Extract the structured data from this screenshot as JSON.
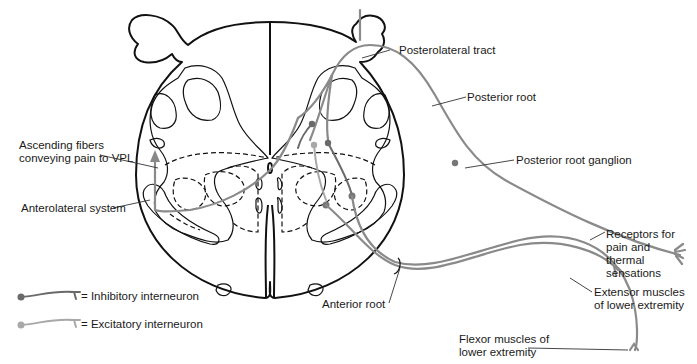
{
  "diagram": {
    "colors": {
      "outline": "#111111",
      "nerve_fiber": "#8a8a8a",
      "excitatory_interneuron": "#a8a8a8",
      "inhibitory_interneuron": "#6a6a6a",
      "background": "#ffffff"
    },
    "labels": {
      "ascending_fibers": "Ascending fibers\nconveying pain to VPL",
      "anterolateral_system": "Anterolateral system",
      "posterolateral_tract": "Posterolateral tract",
      "posterior_root": "Posterior root",
      "posterior_root_ganglion": "Posterior root ganglion",
      "receptors": "Receptors for\npain and\nthermal\nsensations",
      "extensor_muscles": "Extensor muscles\nof lower extremity",
      "flexor_muscles": "Flexor muscles of\nlower extremity",
      "anterior_root": "Anterior root"
    },
    "legend": [
      {
        "symbol": "inhibitory-neuron-symbol",
        "label": "= Inhibitory interneuron",
        "color": "#6a6a6a"
      },
      {
        "symbol": "excitatory-neuron-symbol",
        "label": "= Excitatory interneuron",
        "color": "#a8a8a8"
      }
    ]
  }
}
